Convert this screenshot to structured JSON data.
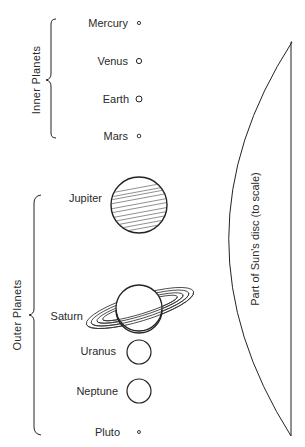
{
  "diagram": {
    "groups": {
      "inner": {
        "label": "Inner Planets"
      },
      "outer": {
        "label": "Outer Planets"
      }
    },
    "planets": [
      {
        "name": "Mercury",
        "group": "inner",
        "x": 139,
        "y": 23,
        "r": 1.6
      },
      {
        "name": "Venus",
        "group": "inner",
        "x": 139,
        "y": 61,
        "r": 2.6
      },
      {
        "name": "Earth",
        "group": "inner",
        "x": 139,
        "y": 99,
        "r": 3
      },
      {
        "name": "Mars",
        "group": "inner",
        "x": 139,
        "y": 136,
        "r": 1.8
      },
      {
        "name": "Jupiter",
        "group": "outer",
        "x": 139,
        "y": 205,
        "r": 28
      },
      {
        "name": "Saturn",
        "group": "outer",
        "x": 139,
        "y": 308,
        "r": 23
      },
      {
        "name": "Uranus",
        "group": "outer",
        "x": 139,
        "y": 352,
        "r": 12
      },
      {
        "name": "Neptune",
        "group": "outer",
        "x": 139,
        "y": 391,
        "r": 12
      },
      {
        "name": "Pluto",
        "group": "outer",
        "x": 139,
        "y": 432,
        "r": 1.5
      }
    ],
    "sun": {
      "label": "Part of Sun's disc (to scale)"
    },
    "colors": {
      "ink": "#222222",
      "background": "#ffffff"
    }
  }
}
